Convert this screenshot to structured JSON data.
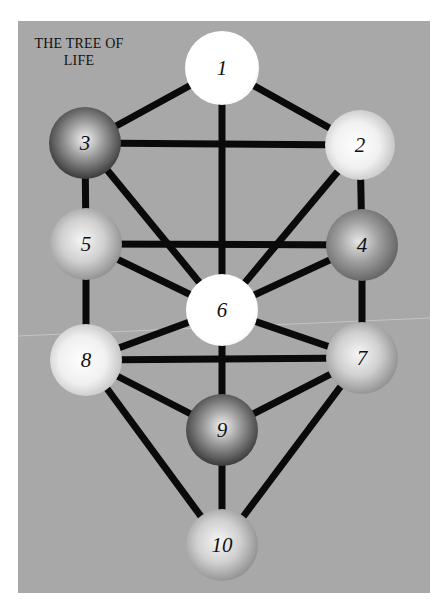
{
  "title_line1": "THE TREE OF",
  "title_line2": "LIFE",
  "colors": {
    "background": "#a8a8a8",
    "line": "#0a0a0a",
    "page": "#ffffff"
  },
  "nodes": [
    {
      "id": "1",
      "label": "1",
      "x": 222,
      "y": 68,
      "r": 37,
      "tone": "white"
    },
    {
      "id": "2",
      "label": "2",
      "x": 360,
      "y": 145,
      "r": 35,
      "tone": "light"
    },
    {
      "id": "3",
      "label": "3",
      "x": 85,
      "y": 143,
      "r": 36,
      "tone": "dark"
    },
    {
      "id": "4",
      "label": "4",
      "x": 362,
      "y": 245,
      "r": 36,
      "tone": "mid-dark"
    },
    {
      "id": "5",
      "label": "5",
      "x": 86,
      "y": 244,
      "r": 36,
      "tone": "mid"
    },
    {
      "id": "6",
      "label": "6",
      "x": 222,
      "y": 310,
      "r": 36,
      "tone": "white"
    },
    {
      "id": "7",
      "label": "7",
      "x": 362,
      "y": 358,
      "r": 36,
      "tone": "mid"
    },
    {
      "id": "8",
      "label": "8",
      "x": 86,
      "y": 360,
      "r": 36,
      "tone": "light"
    },
    {
      "id": "9",
      "label": "9",
      "x": 222,
      "y": 430,
      "r": 36,
      "tone": "dark"
    },
    {
      "id": "10",
      "label": "10",
      "x": 222,
      "y": 545,
      "r": 36,
      "tone": "mid"
    }
  ],
  "edges": [
    [
      "1",
      "3"
    ],
    [
      "1",
      "2"
    ],
    [
      "1",
      "6"
    ],
    [
      "3",
      "2"
    ],
    [
      "3",
      "5"
    ],
    [
      "3",
      "6"
    ],
    [
      "2",
      "4"
    ],
    [
      "2",
      "6"
    ],
    [
      "5",
      "4"
    ],
    [
      "5",
      "6"
    ],
    [
      "5",
      "8"
    ],
    [
      "4",
      "6"
    ],
    [
      "4",
      "7"
    ],
    [
      "6",
      "8"
    ],
    [
      "6",
      "7"
    ],
    [
      "6",
      "9"
    ],
    [
      "8",
      "7"
    ],
    [
      "8",
      "9"
    ],
    [
      "7",
      "9"
    ],
    [
      "8",
      "10"
    ],
    [
      "9",
      "10"
    ],
    [
      "7",
      "10"
    ]
  ]
}
